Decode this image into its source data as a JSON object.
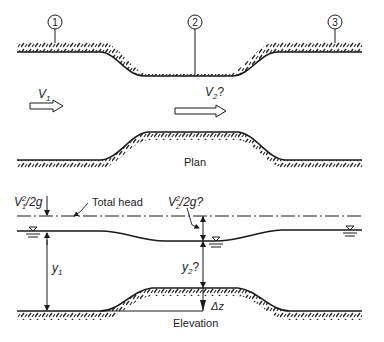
{
  "figure": {
    "type": "open-channel flow over a raised bed / channel contraction",
    "plan_view": {
      "caption": "Plan",
      "section_markers": [
        "1",
        "2",
        "3"
      ],
      "velocity_labels": {
        "upstream": "V",
        "upstream_sub": "1",
        "contraction": "V",
        "contraction_sub": "2",
        "contraction_suffix": "?"
      }
    },
    "elevation_view": {
      "caption": "Elevation",
      "total_head_label": "Total head",
      "velocity_head_1": {
        "main": "V",
        "sup": "2",
        "sub": "1",
        "tail": "/2g"
      },
      "velocity_head_2": {
        "main": "V",
        "sup": "2",
        "sub": "2",
        "tail": "/2g?"
      },
      "depth_1": {
        "main": "y",
        "sub": "1",
        "tail": ""
      },
      "depth_2": {
        "main": "y",
        "sub": "2",
        "tail": "?"
      },
      "bed_step": "Δz"
    }
  },
  "colors": {
    "line": "#1a1a1a",
    "hatch": "#2a2a2a",
    "background": "#ffffff"
  }
}
